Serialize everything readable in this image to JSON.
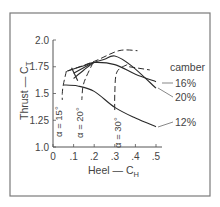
{
  "chart_data": {
    "type": "line",
    "title": "",
    "xlabel": "Heel — C",
    "xlabel_sub": "H",
    "ylabel": "Thrust — C",
    "ylabel_sub": "T",
    "xlim": [
      0,
      0.5
    ],
    "ylim": [
      1.0,
      2.0
    ],
    "x_ticks": [
      0,
      0.1,
      0.2,
      0.3,
      0.4,
      0.5
    ],
    "x_tick_labels": [
      "0",
      ".1",
      ".2",
      ".3",
      ".4",
      ".5"
    ],
    "y_ticks": [
      1.0,
      1.25,
      1.5,
      1.75,
      2.0
    ],
    "y_tick_labels": [
      "1.0",
      "1.25",
      "1.5",
      "1.75",
      "2.0"
    ],
    "grid": false,
    "legend_title": "camber",
    "legend_placement": "right",
    "series": [
      {
        "name": "12%",
        "style": "solid",
        "x": [
          0.05,
          0.12,
          0.2,
          0.3,
          0.4,
          0.5
        ],
        "y": [
          1.58,
          1.57,
          1.52,
          1.37,
          1.27,
          1.19
        ]
      },
      {
        "name": "16%",
        "style": "solid",
        "x": [
          0.07,
          0.15,
          0.2,
          0.3,
          0.4,
          0.5
        ],
        "y": [
          1.71,
          1.76,
          1.79,
          1.77,
          1.68,
          1.61
        ]
      },
      {
        "name": "20%",
        "style": "solid",
        "x": [
          0.1,
          0.15,
          0.2,
          0.25,
          0.3,
          0.38,
          0.5
        ],
        "y": [
          1.64,
          1.72,
          1.79,
          1.82,
          1.85,
          1.76,
          1.55
        ]
      }
    ],
    "constant_alpha_lines": [
      {
        "name": "α = 15°",
        "style": "dashed",
        "x": [
          0.065,
          0.05,
          0.045,
          0.045
        ],
        "y": [
          1.71,
          1.58,
          1.5,
          1.44
        ]
      },
      {
        "name": "α = 20°",
        "style": "dashed",
        "x": [
          0.195,
          0.16,
          0.145,
          0.14
        ],
        "y": [
          1.79,
          1.65,
          1.56,
          1.44
        ]
      },
      {
        "name": "α = 30°",
        "style": "dashed",
        "x": [
          0.36,
          0.31,
          0.3,
          0.3
        ],
        "y": [
          1.77,
          1.7,
          1.5,
          1.32
        ]
      }
    ],
    "envelopes": [
      {
        "name": "upper-envelope",
        "style": "dashed",
        "x": [
          0.07,
          0.2,
          0.32,
          0.41
        ],
        "y": [
          1.71,
          1.8,
          1.9,
          1.9
        ]
      },
      {
        "name": "right-envelope",
        "style": "dashed",
        "x": [
          0.37,
          0.47
        ],
        "y": [
          1.75,
          1.72
        ]
      }
    ],
    "tangent_lines": [
      {
        "name": "tangent-1",
        "x": [
          0.195,
          0.1
        ],
        "y": [
          1.79,
          1.69
        ]
      },
      {
        "name": "tangent-2",
        "x": [
          0.09,
          0.12
        ],
        "y": [
          1.74,
          1.62
        ]
      }
    ]
  }
}
